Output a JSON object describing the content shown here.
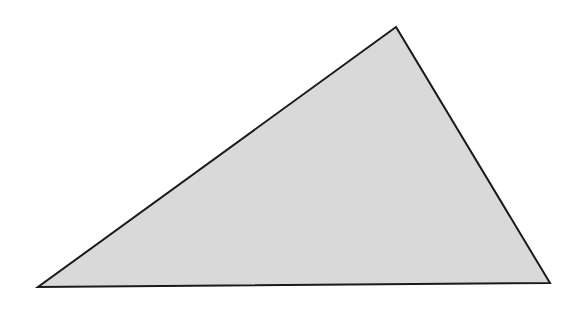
{
  "diagram": {
    "shape": "triangle",
    "vertices": {
      "top": [
        396,
        27
      ],
      "bottom_left": [
        38,
        287
      ],
      "bottom_right": [
        550,
        283
      ]
    },
    "fill": "#d9d9d9",
    "stroke": "#1a1a1a",
    "stroke_width": 2
  }
}
